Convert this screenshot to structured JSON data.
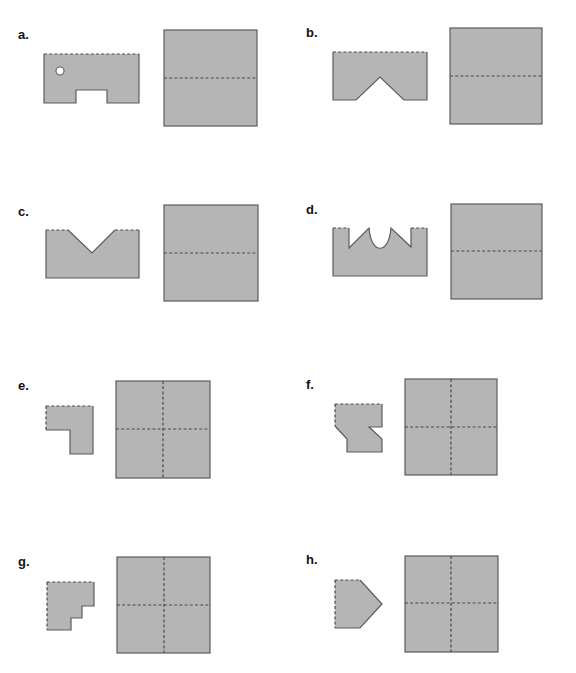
{
  "figure": {
    "colors": {
      "fill": "#b5b5b5",
      "edge": "#5c5c5c",
      "fold_line": "#4a4a4a",
      "hole": "#ffffff",
      "background": "#ffffff"
    },
    "panels": [
      {
        "label": "a.",
        "folded_shape": "rectangle with bottom notch and hole",
        "paper_folds": "horizontal"
      },
      {
        "label": "b.",
        "folded_shape": "rectangle with V notch at bottom",
        "paper_folds": "horizontal"
      },
      {
        "label": "c.",
        "folded_shape": "rectangle with V notch at top",
        "paper_folds": "horizontal"
      },
      {
        "label": "d.",
        "folded_shape": "rectangle with crown-shaped cut at top",
        "paper_folds": "horizontal"
      },
      {
        "label": "e.",
        "folded_shape": "L-shape",
        "paper_folds": "horizontal and vertical"
      },
      {
        "label": "f.",
        "folded_shape": "square with cut corner and side notch",
        "paper_folds": "horizontal and vertical"
      },
      {
        "label": "g.",
        "folded_shape": "staircase",
        "paper_folds": "horizontal and vertical"
      },
      {
        "label": "h.",
        "folded_shape": "pentagon arrow",
        "paper_folds": "horizontal and vertical"
      }
    ]
  }
}
